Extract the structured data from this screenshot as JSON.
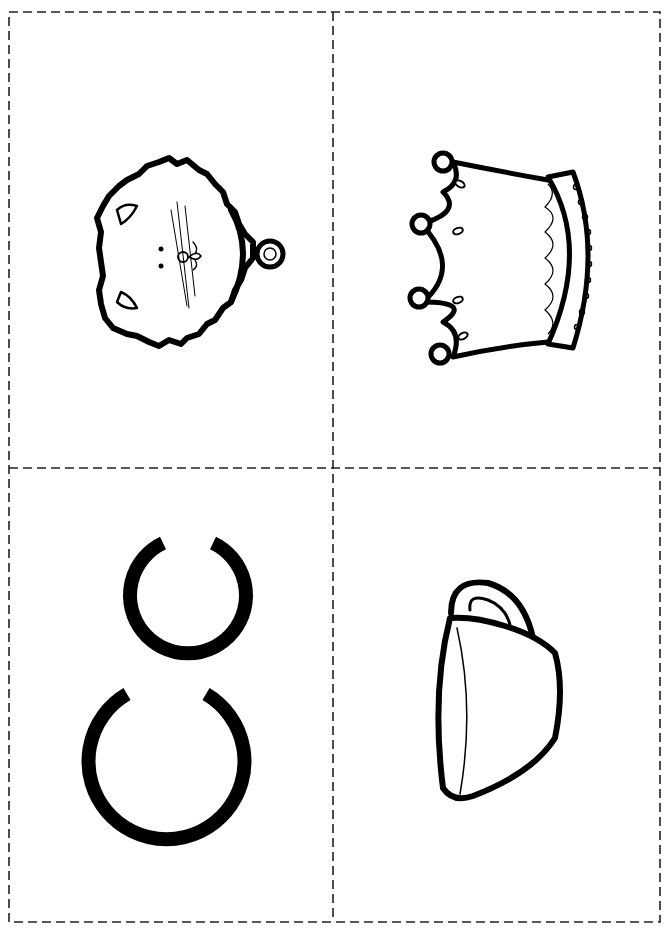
{
  "page": {
    "background": "#ffffff",
    "line_color": "#111111",
    "cut_line_style": "dashed"
  },
  "cards": [
    {
      "id": "cat",
      "label": "cat",
      "position": "top-left"
    },
    {
      "id": "crown",
      "label": "crown",
      "position": "top-right"
    },
    {
      "id": "letter",
      "label": "C c",
      "position": "bottom-left"
    },
    {
      "id": "cup",
      "label": "cup",
      "position": "bottom-right"
    }
  ]
}
